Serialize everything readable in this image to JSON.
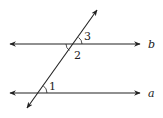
{
  "diagram": {
    "type": "parallel-lines-transversal",
    "lines": [
      {
        "name": "b",
        "label": "b"
      },
      {
        "name": "a",
        "label": "a"
      }
    ],
    "angles": [
      {
        "label": "1",
        "position": "upper-right of transversal at line a"
      },
      {
        "label": "2",
        "position": "lower-left of transversal at line b"
      },
      {
        "label": "3",
        "position": "upper-right of transversal at line b"
      }
    ],
    "colors": {
      "stroke": "#222222",
      "background": "#ffffff"
    }
  }
}
